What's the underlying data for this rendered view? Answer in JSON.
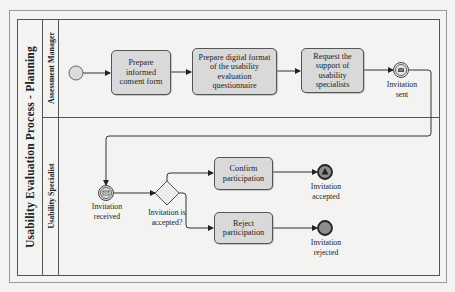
{
  "pool": {
    "title": "Usability Evaluation Process - Planning"
  },
  "lanes": [
    {
      "label": "Assessment Manager"
    },
    {
      "label": "Usability Specialist"
    }
  ],
  "tasks": {
    "t1": "Prepare informed consent form",
    "t1_lines": [
      "Prepare",
      "informed",
      "consent form"
    ],
    "t2_lines": [
      "Prepare digital format",
      "of the usability",
      "evaluation",
      "questionnaire"
    ],
    "t3_lines": [
      "Request the",
      "support of",
      "usability",
      "specialists"
    ],
    "t4_lines": [
      "Confirm",
      "participation"
    ],
    "t5_lines": [
      "Reject",
      "participation"
    ]
  },
  "events": {
    "start": {
      "type": "start-event"
    },
    "invitation_sent": {
      "type": "intermediate-message-throw",
      "label_lines": [
        "Invitation",
        "sent"
      ]
    },
    "invitation_received": {
      "type": "intermediate-message-catch",
      "label_lines": [
        "Invitation",
        "received"
      ]
    },
    "invitation_accepted": {
      "type": "end-signal-event",
      "label_lines": [
        "Invitation",
        "accepted"
      ]
    },
    "invitation_rejected": {
      "type": "end-event",
      "label_lines": [
        "Invitation",
        "rejected"
      ]
    }
  },
  "gateway": {
    "type": "exclusive-gateway",
    "label_lines": [
      "Invitation is",
      "accepted?"
    ]
  },
  "colors": {
    "task_fill": "#d9d9d9",
    "event_fill": "#dcdcdc",
    "end_fill": "#8c8c8c",
    "line": "#333333",
    "background": "#f3f3f1"
  }
}
